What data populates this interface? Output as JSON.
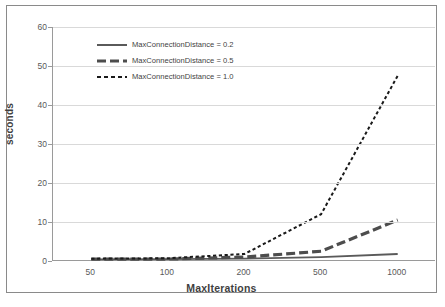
{
  "chart_data": {
    "type": "line",
    "title": "",
    "xlabel": "MaxIterations",
    "ylabel": "seconds",
    "categories": [
      "50",
      "100",
      "200",
      "500",
      "1000"
    ],
    "x": [
      50,
      100,
      200,
      500,
      1000
    ],
    "ylim": [
      0,
      60
    ],
    "yticks": [
      0,
      10,
      20,
      30,
      40,
      50,
      60
    ],
    "grid": true,
    "legend_position": "upper-left-inside",
    "series": [
      {
        "name": "MaxConnectionDistance = 0.2",
        "style": "solid",
        "color": "#5a5a5a",
        "values": [
          0.4,
          0.5,
          0.6,
          1.0,
          1.8
        ]
      },
      {
        "name": "MaxConnectionDistance = 0.5",
        "style": "dashed",
        "color": "#4d4d4d",
        "values": [
          0.5,
          0.5,
          1.0,
          2.5,
          10.5
        ]
      },
      {
        "name": "MaxConnectionDistance = 1.0",
        "style": "dotted",
        "color": "#1a1a1a",
        "values": [
          0.6,
          0.7,
          1.8,
          12.0,
          47.5
        ]
      }
    ]
  },
  "axis": {
    "y_tick_labels": [
      "60",
      "50",
      "40",
      "30",
      "20",
      "10",
      "0"
    ],
    "x_tick_labels": [
      "50",
      "100",
      "200",
      "500",
      "1000"
    ],
    "y_title": "seconds",
    "x_title": "MaxIterations"
  },
  "legend": {
    "items": [
      {
        "label": "MaxConnectionDistance = 0.2"
      },
      {
        "label": "MaxConnectionDistance = 0.5"
      },
      {
        "label": "MaxConnectionDistance = 1.0"
      }
    ]
  },
  "colors": {
    "grid": "#d9d9d9",
    "axis": "#9a9a9a",
    "text": "#595959",
    "title_text": "#3f3f3f",
    "frame": "#8a8a8a",
    "background": "#ffffff"
  }
}
